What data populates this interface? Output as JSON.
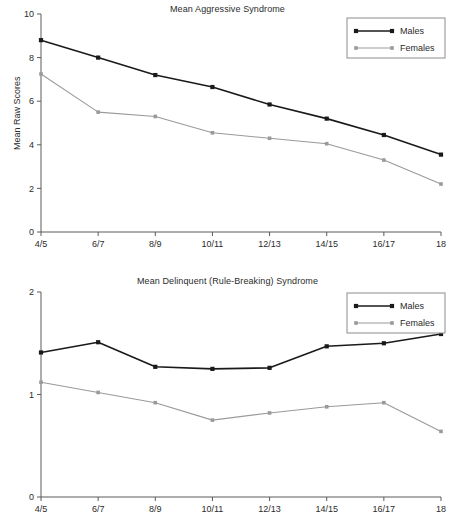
{
  "chart_data": [
    {
      "type": "line",
      "title": "Mean Aggressive Syndrome",
      "xlabel": "",
      "ylabel": "Mean Raw Scores",
      "categories": [
        "4/5",
        "6/7",
        "8/9",
        "10/11",
        "12/13",
        "14/15",
        "16/17",
        "18"
      ],
      "ylim": [
        0,
        10
      ],
      "yticks": [
        0,
        2,
        4,
        6,
        8,
        10
      ],
      "ytick_labels": [
        "0",
        "2",
        "4",
        "6",
        "8",
        "10"
      ],
      "grid": false,
      "legend_position": "top-right",
      "series": [
        {
          "name": "Males",
          "color": "#1a1a1a",
          "values": [
            8.8,
            8.0,
            7.2,
            6.65,
            5.85,
            5.2,
            4.45,
            3.55
          ]
        },
        {
          "name": "Females",
          "color": "#9a9a9a",
          "values": [
            7.25,
            5.5,
            5.3,
            4.55,
            4.3,
            4.05,
            3.3,
            2.2
          ]
        }
      ]
    },
    {
      "type": "line",
      "title": "Mean Delinquent (Rule-Breaking) Syndrome",
      "xlabel": "",
      "ylabel": "Mean Raw Scores",
      "categories": [
        "4/5",
        "6/7",
        "8/9",
        "10/11",
        "12/13",
        "14/15",
        "16/17",
        "18"
      ],
      "ylim": [
        0,
        2
      ],
      "yticks": [
        0,
        1,
        2
      ],
      "ytick_labels": [
        "0",
        "1",
        "2"
      ],
      "grid": false,
      "legend_position": "top-right",
      "series": [
        {
          "name": "Males",
          "color": "#1a1a1a",
          "values": [
            1.41,
            1.51,
            1.27,
            1.25,
            1.26,
            1.47,
            1.5,
            1.59
          ]
        },
        {
          "name": "Females",
          "color": "#9a9a9a",
          "values": [
            1.12,
            1.02,
            0.92,
            0.75,
            0.82,
            0.88,
            0.92,
            0.64
          ]
        }
      ]
    }
  ]
}
